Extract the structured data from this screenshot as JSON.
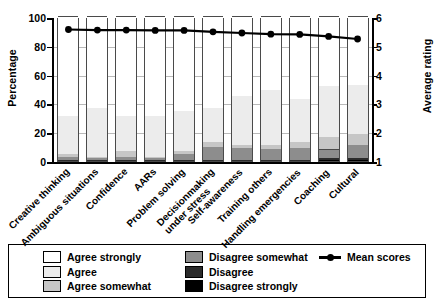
{
  "chart_data": {
    "type": "bar",
    "subtype": "stacked-bar-with-line",
    "title": "",
    "xlabel": "",
    "ylabel": "Percentage",
    "y2label": "Average rating",
    "ylim": [
      0,
      100
    ],
    "y2lim": [
      1,
      6
    ],
    "yticks": [
      0,
      20,
      40,
      60,
      80,
      100
    ],
    "y2ticks": [
      1,
      2,
      3,
      4,
      5,
      6
    ],
    "grid": true,
    "legend_position": "bottom",
    "categories": [
      "Creative thinking",
      "Ambiguous situations",
      "Confidence",
      "AARs",
      "Problem solving",
      "Decisionmaking under stress",
      "Self-awareness",
      "Training others",
      "Handling emergencies",
      "Coaching",
      "Cultural"
    ],
    "series": [
      {
        "name": "Agree strongly",
        "color": "#ffffff",
        "values": [
          69,
          63,
          69,
          69,
          65,
          63,
          55,
          51,
          57,
          48,
          47
        ]
      },
      {
        "name": "Agree",
        "color": "#ececec",
        "values": [
          26,
          34,
          24,
          28,
          28,
          24,
          34,
          38,
          30,
          35,
          34
        ]
      },
      {
        "name": "Agree somewhat",
        "color": "#c6c6c6",
        "values": [
          2,
          1,
          4,
          1,
          2,
          3,
          2,
          3,
          4,
          9,
          8
        ]
      },
      {
        "name": "Disagree somewhat",
        "color": "#8d8d8d",
        "values": [
          2,
          1,
          2,
          1,
          4,
          9,
          8,
          7,
          8,
          6,
          9
        ]
      },
      {
        "name": "Disagree",
        "color": "#2b2b2b",
        "values": [
          1,
          1,
          1,
          1,
          1,
          1,
          1,
          1,
          1,
          1,
          1
        ]
      },
      {
        "name": "Disagree strongly",
        "color": "#000000",
        "values": [
          0,
          0,
          0,
          0,
          0,
          0,
          0,
          0,
          0,
          1,
          1
        ]
      }
    ],
    "line_series": {
      "name": "Mean scores",
      "color": "#000000",
      "axis": "right",
      "values": [
        5.6,
        5.58,
        5.58,
        5.57,
        5.57,
        5.52,
        5.48,
        5.44,
        5.43,
        5.36,
        5.27
      ]
    }
  },
  "axes": {
    "left_title": "Percentage",
    "right_title": "Average rating",
    "left_ticks": [
      "100",
      "80",
      "60",
      "40",
      "20",
      "0"
    ],
    "right_ticks": [
      "6",
      "5",
      "4",
      "3",
      "2",
      "1"
    ]
  },
  "legend": {
    "column1": [
      {
        "label": "Agree strongly",
        "color": "#ffffff"
      },
      {
        "label": "Agree",
        "color": "#ececec"
      },
      {
        "label": "Agree somewhat",
        "color": "#c6c6c6"
      }
    ],
    "column2": [
      {
        "label": "Disagree somewhat",
        "color": "#8d8d8d"
      },
      {
        "label": "Disagree",
        "color": "#2b2b2b"
      },
      {
        "label": "Disagree strongly",
        "color": "#000000"
      }
    ],
    "line_entry": {
      "label": "Mean scores",
      "color": "#000000"
    }
  }
}
